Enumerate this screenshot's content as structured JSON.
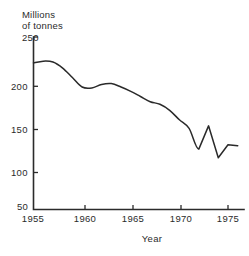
{
  "chart_data": {
    "type": "line",
    "title": "",
    "subtitle": "",
    "xlabel": "Year",
    "ylabel": "Millions of tonnes",
    "ylabel_lines": [
      "Millions",
      "of tonnes"
    ],
    "xlim": [
      1955,
      1976
    ],
    "ylim": [
      50,
      250
    ],
    "xticks": [
      1955,
      1960,
      1965,
      1970,
      1975
    ],
    "xtick_labels": [
      "1955",
      "1960",
      "1965",
      "1970",
      "1975"
    ],
    "yticks": [
      50,
      100,
      150,
      200,
      250
    ],
    "ytick_labels": [
      "50",
      "100",
      "150",
      "200",
      "250"
    ],
    "grid": false,
    "legend": "none",
    "series": [
      {
        "name": "Production",
        "x": [
          1955,
          1956,
          1957,
          1958,
          1959,
          1960,
          1961,
          1962,
          1963,
          1964,
          1965,
          1966,
          1967,
          1968,
          1969,
          1970,
          1971,
          1972,
          1973,
          1974,
          1975,
          1976
        ],
        "values": [
          220,
          222,
          221,
          214,
          203,
          192,
          191,
          195,
          196,
          192,
          187,
          181,
          175,
          172,
          165,
          154,
          144,
          120,
          147,
          110,
          125,
          124
        ]
      }
    ]
  },
  "axes": {
    "y_axis_name": "y-axis",
    "x_axis_name": "x-axis"
  }
}
